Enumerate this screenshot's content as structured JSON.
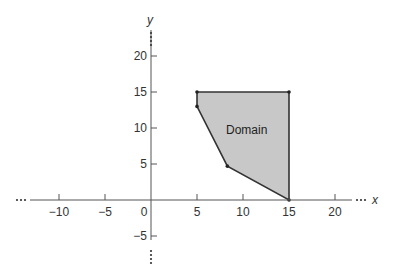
{
  "diagram": {
    "type": "coordinate-plane-region",
    "x_axis_label": "x",
    "y_axis_label": "y",
    "region_label": "Domain",
    "region_fill": "#c8c8c8",
    "line_color": "#333333",
    "x_ticks": [
      {
        "value": -10,
        "label": "−10"
      },
      {
        "value": -5,
        "label": "−5"
      },
      {
        "value": 0,
        "label": "0"
      },
      {
        "value": 5,
        "label": "5"
      },
      {
        "value": 10,
        "label": "10"
      },
      {
        "value": 15,
        "label": "15"
      },
      {
        "value": 20,
        "label": "20"
      }
    ],
    "y_ticks": [
      {
        "value": -5,
        "label": "−5"
      },
      {
        "value": 5,
        "label": "5"
      },
      {
        "value": 10,
        "label": "10"
      },
      {
        "value": 15,
        "label": "15"
      },
      {
        "value": 20,
        "label": "20"
      }
    ],
    "continuation": "…",
    "polygon_vertices": [
      [
        5,
        15
      ],
      [
        15,
        15
      ],
      [
        15,
        0
      ],
      [
        8.3,
        4.7
      ],
      [
        5,
        13
      ]
    ]
  }
}
